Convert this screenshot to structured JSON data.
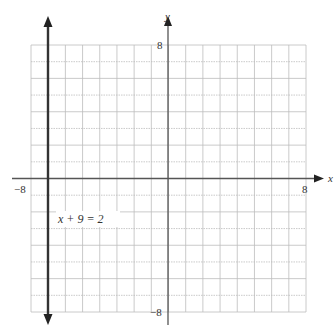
{
  "chart_data": {
    "type": "line",
    "title": "",
    "equation_label": "x + 9 = 2",
    "xlabel": "x",
    "ylabel": "y",
    "xlim": [
      -8,
      8
    ],
    "ylim": [
      -8,
      8
    ],
    "grid": true,
    "tick_labels": {
      "x_min": "−8",
      "x_max": "8",
      "y_max": "8",
      "y_min": "−8"
    },
    "series": [
      {
        "name": "x + 9 = 2",
        "kind": "vertical-line",
        "x": -7,
        "arrows": "both"
      }
    ]
  },
  "colors": {
    "grid": "#bdbdbd",
    "axis": "#444444",
    "line": "#333333",
    "text": "#333333"
  }
}
